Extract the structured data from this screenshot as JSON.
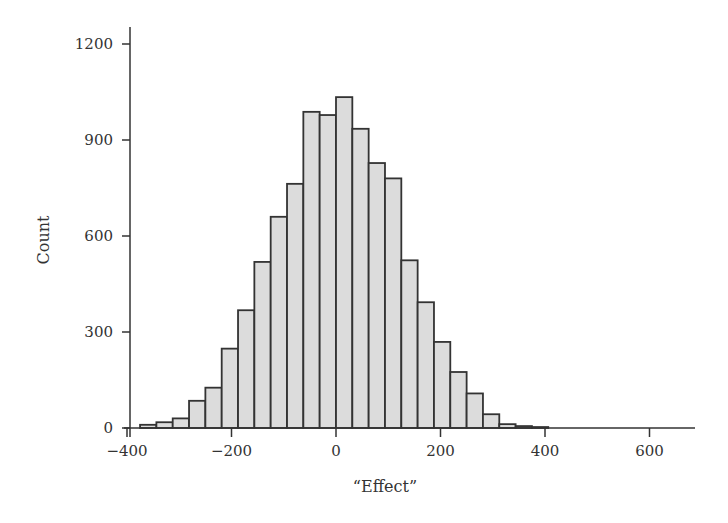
{
  "chart_data": {
    "type": "bar",
    "subtype": "histogram",
    "title": "",
    "xlabel": "“Effect”",
    "ylabel": "Count",
    "xlim": [
      -400,
      684
    ],
    "ylim": [
      0,
      1260
    ],
    "x_ticks": [
      -400,
      -200,
      0,
      200,
      400,
      600
    ],
    "x_tick_labels": [
      "−400",
      "−200",
      "0",
      "200",
      "400",
      "600"
    ],
    "y_ticks": [
      0,
      300,
      600,
      900,
      1200
    ],
    "y_tick_labels": [
      "0",
      "300",
      "600",
      "900",
      "1200"
    ],
    "bin_width": 31.25,
    "bin_start": -375,
    "bin_edges": [
      -375,
      -343.75,
      -312.5,
      -281.25,
      -250,
      -218.75,
      -187.5,
      -156.25,
      -125,
      -93.75,
      -62.5,
      -31.25,
      0,
      31.25,
      62.5,
      93.75,
      125,
      156.25,
      187.5,
      218.75,
      250,
      281.25,
      312.5,
      343.75,
      375,
      406.25
    ],
    "values": [
      10,
      18,
      30,
      85,
      126,
      248,
      368,
      519,
      660,
      763,
      988,
      978,
      1034,
      935,
      828,
      780,
      524,
      393,
      269,
      175,
      108,
      43,
      12,
      6,
      3
    ],
    "grid": false,
    "legend": null,
    "colors": {
      "bar_fill": "#dcdcdc",
      "bar_edge": "#333333",
      "axis": "#333333"
    }
  }
}
